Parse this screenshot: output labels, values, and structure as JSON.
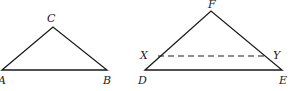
{
  "diagram": {
    "type": "geometry-triangles",
    "triangle_abc": {
      "vertices": {
        "A": {
          "label": "A",
          "x": 2,
          "y": 70
        },
        "B": {
          "label": "B",
          "x": 107,
          "y": 70
        },
        "C": {
          "label": "C",
          "x": 53,
          "y": 27
        }
      }
    },
    "triangle_def": {
      "vertices": {
        "D": {
          "label": "D",
          "x": 145,
          "y": 70
        },
        "E": {
          "label": "E",
          "x": 282,
          "y": 70
        },
        "F": {
          "label": "F",
          "x": 211,
          "y": 11
        }
      },
      "segment_xy": {
        "X": {
          "label": "X",
          "x": 158,
          "y": 56
        },
        "Y": {
          "label": "Y",
          "x": 266,
          "y": 56
        },
        "style": "dashed"
      }
    }
  }
}
